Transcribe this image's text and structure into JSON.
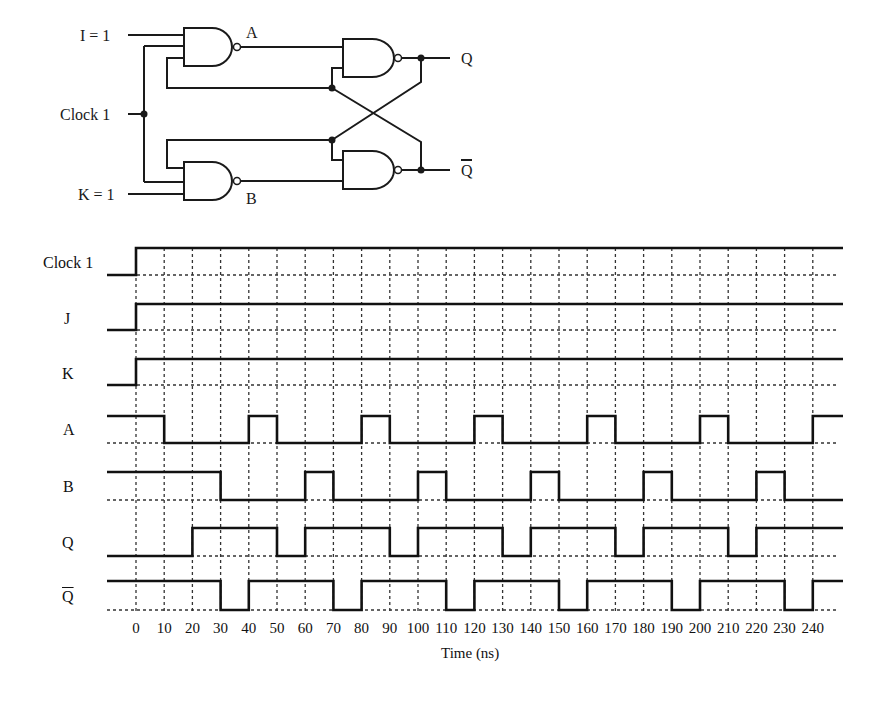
{
  "circuit": {
    "title": "JK flip-flop (NAND implementation)",
    "inputs": [
      {
        "label": "I = 1",
        "y": 35
      },
      {
        "label": "Clock 1",
        "y": 114
      },
      {
        "label": "K = 1",
        "y": 194
      }
    ],
    "nodes": [
      {
        "label": "A"
      },
      {
        "label": "B"
      }
    ],
    "outputs": [
      {
        "label": "Q"
      },
      {
        "label": "Q",
        "overbar": true
      }
    ]
  },
  "chart_data": {
    "type": "timing",
    "title": "",
    "xlabel": "Time (ns)",
    "ylabel": "",
    "x_ticks": [
      0,
      10,
      20,
      30,
      40,
      50,
      60,
      70,
      80,
      90,
      100,
      110,
      120,
      130,
      140,
      150,
      160,
      170,
      180,
      190,
      200,
      210,
      220,
      230,
      240
    ],
    "x_range": [
      -10,
      250
    ],
    "grid": true,
    "signals": [
      {
        "name": "Clock 1",
        "initial": 0,
        "transitions": [
          [
            0,
            1
          ]
        ]
      },
      {
        "name": "J",
        "initial": 0,
        "transitions": [
          [
            0,
            1
          ]
        ]
      },
      {
        "name": "K",
        "initial": 0,
        "transitions": [
          [
            0,
            1
          ]
        ]
      },
      {
        "name": "A",
        "initial": 1,
        "transitions": [
          [
            10,
            0
          ],
          [
            40,
            1
          ],
          [
            50,
            0
          ],
          [
            80,
            1
          ],
          [
            90,
            0
          ],
          [
            120,
            1
          ],
          [
            130,
            0
          ],
          [
            160,
            1
          ],
          [
            170,
            0
          ],
          [
            200,
            1
          ],
          [
            210,
            0
          ],
          [
            240,
            1
          ]
        ]
      },
      {
        "name": "B",
        "initial": 1,
        "transitions": [
          [
            30,
            0
          ],
          [
            60,
            1
          ],
          [
            70,
            0
          ],
          [
            100,
            1
          ],
          [
            110,
            0
          ],
          [
            140,
            1
          ],
          [
            150,
            0
          ],
          [
            180,
            1
          ],
          [
            190,
            0
          ],
          [
            220,
            1
          ],
          [
            230,
            0
          ]
        ]
      },
      {
        "name": "Q",
        "initial": 0,
        "transitions": [
          [
            20,
            1
          ],
          [
            50,
            0
          ],
          [
            60,
            1
          ],
          [
            90,
            0
          ],
          [
            100,
            1
          ],
          [
            130,
            0
          ],
          [
            140,
            1
          ],
          [
            170,
            0
          ],
          [
            180,
            1
          ],
          [
            210,
            0
          ],
          [
            220,
            1
          ]
        ]
      },
      {
        "name": "Q̄",
        "initial": 1,
        "transitions": [
          [
            30,
            0
          ],
          [
            40,
            1
          ],
          [
            70,
            0
          ],
          [
            80,
            1
          ],
          [
            110,
            0
          ],
          [
            120,
            1
          ],
          [
            150,
            0
          ],
          [
            160,
            1
          ],
          [
            190,
            0
          ],
          [
            200,
            1
          ],
          [
            230,
            0
          ],
          [
            240,
            1
          ]
        ]
      }
    ]
  },
  "labels": {
    "xlabel": "Time (ns)",
    "signals": [
      "Clock 1",
      "J",
      "K",
      "A",
      "B",
      "Q",
      "Q"
    ],
    "ticks": [
      "0",
      "10",
      "20",
      "30",
      "40",
      "50",
      "60",
      "70",
      "80",
      "90",
      "100",
      "110",
      "120",
      "130",
      "140",
      "150",
      "160",
      "170",
      "180",
      "190",
      "200",
      "210",
      "220",
      "230",
      "240"
    ]
  }
}
